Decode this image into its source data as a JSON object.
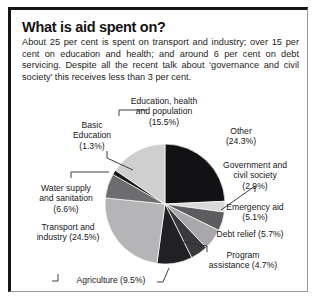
{
  "figure": {
    "title": "What is aid spent on?",
    "blurb": "About 25 per cent is spent on transport and industry; over 15 per cent on education and health; and around 6 per cent on debt servicing. Despite all the recent talk about ‘governance and civil society’ this receives less than 3 per cent.",
    "source": "The Reality of Aid 2000, Earthscan"
  },
  "chart_data": {
    "type": "pie",
    "title": "What is aid spent on?",
    "unit": "per cent",
    "legend": "none",
    "start_angle_deg": 0,
    "direction": "clockwise",
    "labels": [
      "Other",
      "Government and civil society",
      "Emergency aid",
      "Debt relief",
      "Program assistance",
      "Agriculture",
      "Transport and industry",
      "Water supply and sanitation",
      "Basic Education",
      "Education, health and population"
    ],
    "values": [
      24.3,
      2.9,
      5.1,
      5.7,
      4.7,
      9.5,
      24.5,
      6.6,
      1.3,
      15.5
    ],
    "colors": [
      "#121214",
      "#d9d9d9",
      "#5d5d60",
      "#a8a8aa",
      "#3a3a3d",
      "#212123",
      "#b5b5b7",
      "#6d6d70",
      "#1a1a1c",
      "#cfcfd0"
    ],
    "slices": [
      {
        "label": "Other",
        "value": 24.3,
        "display": "Other\n(24.3%)",
        "color": "#121214"
      },
      {
        "label": "Government and civil society",
        "value": 2.9,
        "display": "Government and\ncivil society\n(2.9%)",
        "color": "#d9d9d9"
      },
      {
        "label": "Emergency aid",
        "value": 5.1,
        "display": "Emergency aid\n(5.1%)",
        "color": "#5d5d60"
      },
      {
        "label": "Debt relief",
        "value": 5.7,
        "display": "Debt relief (5.7%)",
        "color": "#a8a8aa"
      },
      {
        "label": "Program assistance",
        "value": 4.7,
        "display": "Program\nassistance (4.7%)",
        "color": "#3a3a3d"
      },
      {
        "label": "Agriculture",
        "value": 9.5,
        "display": "Agriculture (9.5%)",
        "color": "#212123"
      },
      {
        "label": "Transport and industry",
        "value": 24.5,
        "display": "Transport and\nindustry (24.5%)",
        "color": "#b5b5b7"
      },
      {
        "label": "Water supply and sanitation",
        "value": 6.6,
        "display": "Water supply\nand sanitation\n(6.6%)",
        "color": "#6d6d70"
      },
      {
        "label": "Basic Education",
        "value": 1.3,
        "display": "Basic\nEducation\n(1.3%)",
        "color": "#1a1a1c"
      },
      {
        "label": "Education, health and population",
        "value": 15.5,
        "display": "Education, health\nand population\n(15.5%)",
        "color": "#cfcfd0"
      }
    ]
  }
}
